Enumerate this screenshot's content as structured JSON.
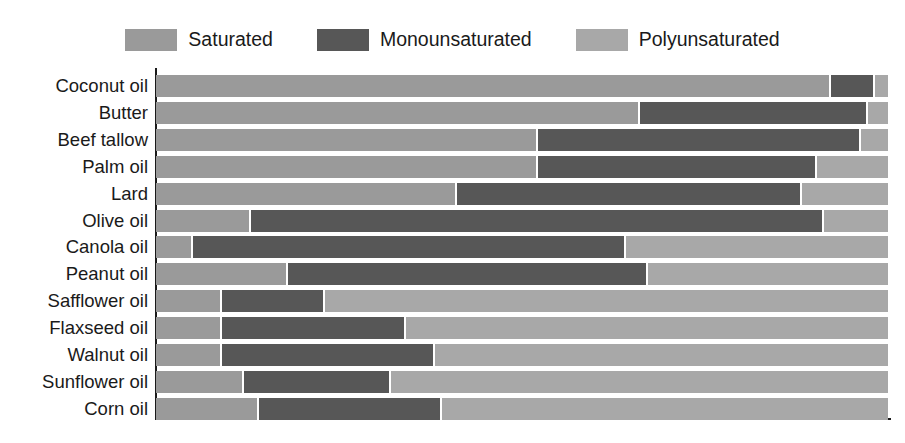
{
  "legend": {
    "position": "top-center",
    "items": [
      {
        "label": "Saturated",
        "color": "#9a9a9a",
        "swatch_name": "legend-swatch-saturated"
      },
      {
        "label": "Monounsaturated",
        "color": "#575757",
        "swatch_name": "legend-swatch-monounsaturated"
      },
      {
        "label": "Polyunsaturated",
        "color": "#a8a8a8",
        "swatch_name": "legend-swatch-polyunsaturated"
      }
    ]
  },
  "chart_data": {
    "type": "bar",
    "orientation": "horizontal",
    "stacked": true,
    "normalized": true,
    "title": "",
    "xlabel": "",
    "ylabel": "",
    "xlim": [
      0,
      100
    ],
    "grid": false,
    "axis_lines": [
      "left",
      "bottom"
    ],
    "tick_labels_x": [],
    "categories": [
      "Coconut oil",
      "Butter",
      "Beef tallow",
      "Palm oil",
      "Lard",
      "Olive oil",
      "Canola oil",
      "Peanut oil",
      "Safflower oil",
      "Flaxseed oil",
      "Walnut oil",
      "Sunflower oil",
      "Corn oil"
    ],
    "series": [
      {
        "name": "Saturated",
        "color": "#9a9a9a",
        "values": [
          92,
          66,
          52,
          52,
          41,
          13,
          5,
          18,
          9,
          9,
          9,
          12,
          14
        ]
      },
      {
        "name": "Monounsaturated",
        "color": "#575757",
        "values": [
          6,
          31,
          44,
          38,
          47,
          78,
          59,
          49,
          14,
          25,
          29,
          20,
          25
        ]
      },
      {
        "name": "Polyunsaturated",
        "color": "#a8a8a8",
        "values": [
          2,
          3,
          4,
          10,
          12,
          9,
          36,
          33,
          77,
          66,
          62,
          68,
          61
        ]
      }
    ]
  }
}
